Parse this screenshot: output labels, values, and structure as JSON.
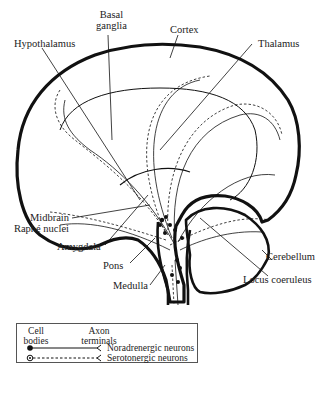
{
  "diagram": {
    "type": "brain-sagittal-neurotransmitter-pathways",
    "labels": {
      "basal_ganglia_1": "Basal",
      "basal_ganglia_2": "ganglia",
      "cortex": "Cortex",
      "hypothalamus": "Hypothalamus",
      "thalamus": "Thalamus",
      "midbrain_raphe_1": "Midbrain",
      "midbrain_raphe_2": "Raphé nuclei",
      "amygdala": "Amygdala",
      "pons": "Pons",
      "medulla": "Medulla",
      "cerebellum": "Cerebellum",
      "locus_coeruleus": "Locus coeruleus"
    },
    "legend": {
      "col1_line1": "Cell",
      "col1_line2": "bodies",
      "col2_line1": "Axon",
      "col2_line2": "terminals",
      "items": [
        {
          "label": "Noradrenergic neurons",
          "line_style": "solid"
        },
        {
          "label": "Serotonergic neurons",
          "line_style": "dashed"
        }
      ]
    },
    "colors": {
      "ink": "#1a1a1a",
      "background": "#ffffff"
    }
  }
}
